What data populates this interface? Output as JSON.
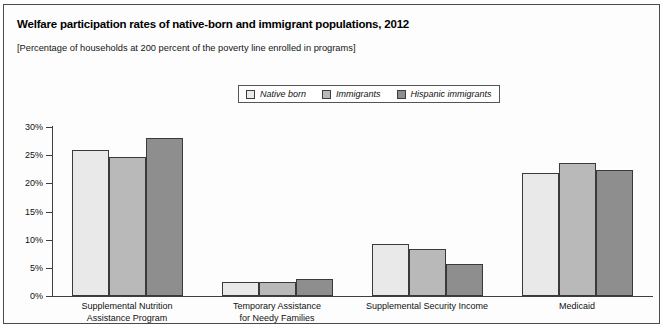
{
  "chart_data": {
    "type": "bar",
    "title": "Welfare participation rates of native-born and immigrant populations, 2012",
    "subtitle": "[Percentage of households at 200 percent of the poverty line enrolled in programs]",
    "xlabel": "",
    "ylabel": "",
    "ylim": [
      0,
      30
    ],
    "ytick_values": [
      0,
      5,
      10,
      15,
      20,
      25,
      30
    ],
    "ytick_labels": [
      "0%",
      "5%",
      "10%",
      "15%",
      "20%",
      "25%",
      "30%"
    ],
    "grid": false,
    "legend_position": "top-center",
    "categories": [
      "Supplemental Nutrition\nAssistance Program",
      "Temporary Assistance\nfor Needy Families",
      "Supplemental Security Income",
      "Medicaid"
    ],
    "category_lines": [
      [
        "Supplemental Nutrition",
        "Assistance Program"
      ],
      [
        "Temporary Assistance",
        "for Needy Families"
      ],
      [
        "Supplemental Security Income",
        ""
      ],
      [
        "Medicaid",
        ""
      ]
    ],
    "series": [
      {
        "name": "Native born",
        "color": "#e9e9e9",
        "values": [
          26.0,
          2.4,
          9.2,
          21.8
        ]
      },
      {
        "name": "Immigrants",
        "color": "#b9b9b9",
        "values": [
          24.7,
          2.4,
          8.4,
          23.6
        ]
      },
      {
        "name": "Hispanic immigrants",
        "color": "#8e8e8e",
        "values": [
          28.0,
          3.1,
          5.7,
          22.3
        ]
      }
    ]
  },
  "style": {
    "frame_border": "#4a4a4a",
    "axis_color": "#3f3f3f",
    "bar_border": "#3a3a3a",
    "background": "#ffffff"
  }
}
